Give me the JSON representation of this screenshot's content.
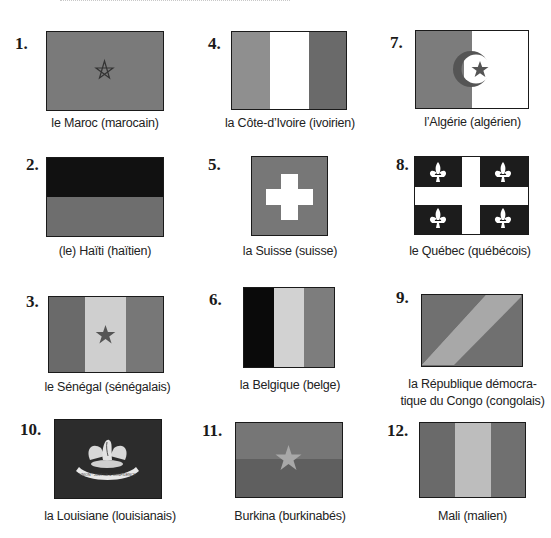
{
  "page": {
    "header_fragment": "... (texte coupé en haut de page) ..."
  },
  "colors": {
    "dark_gray": "#6e6e6e",
    "mid_gray": "#8a8a8a",
    "light_gray": "#c9c9c9",
    "black": "#111111",
    "white": "#ffffff"
  },
  "flags": [
    {
      "number": "1.",
      "caption": "le Maroc (marocain)",
      "icon": "morocco-flag"
    },
    {
      "number": "2.",
      "caption": "(le) Haïti (haïtien)",
      "icon": "haiti-flag"
    },
    {
      "number": "3.",
      "caption": "le Sénégal (sénégalais)",
      "icon": "senegal-flag"
    },
    {
      "number": "4.",
      "caption": "la Côte-d’Ivoire (ivoirien)",
      "icon": "cote-divoire-flag"
    },
    {
      "number": "5.",
      "caption": "la Suisse (suisse)",
      "icon": "switzerland-flag"
    },
    {
      "number": "6.",
      "caption": "la Belgique (belge)",
      "icon": "belgium-flag"
    },
    {
      "number": "7.",
      "caption": "l’Algérie (algérien)",
      "icon": "algeria-flag"
    },
    {
      "number": "8.",
      "caption": "le Québec (québécois)",
      "icon": "quebec-flag"
    },
    {
      "number": "9.",
      "caption_line1": "la République démocra-",
      "caption_line2": "tique du Congo (congolais)",
      "icon": "drc-flag"
    },
    {
      "number": "10.",
      "caption": "la Louisiane (louisianais)",
      "icon": "louisiana-flag",
      "seal_text": "UNION · JUSTICE & CONFIDENCE"
    },
    {
      "number": "11.",
      "caption": "Burkina (burkinabés)",
      "icon": "burkina-flag"
    },
    {
      "number": "12.",
      "caption": "Mali (malien)",
      "icon": "mali-flag"
    }
  ]
}
